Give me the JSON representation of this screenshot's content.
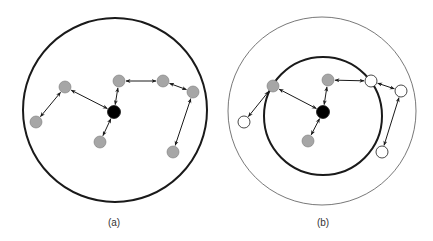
{
  "figure": {
    "panels": [
      {
        "id": "a",
        "caption": "(a)",
        "nodes": [
          {
            "id": "n1",
            "type": "gray"
          },
          {
            "id": "n2",
            "type": "gray"
          },
          {
            "id": "center",
            "type": "black"
          },
          {
            "id": "n3",
            "type": "gray"
          },
          {
            "id": "n4",
            "type": "gray"
          },
          {
            "id": "n5",
            "type": "gray"
          },
          {
            "id": "n6",
            "type": "gray"
          },
          {
            "id": "n7",
            "type": "gray"
          }
        ],
        "edges": [
          [
            "n2",
            "n1"
          ],
          [
            "n1",
            "center"
          ],
          [
            "center",
            "n3"
          ],
          [
            "center",
            "n4"
          ],
          [
            "n4",
            "n5"
          ],
          [
            "n5",
            "n6"
          ],
          [
            "n6",
            "n7"
          ]
        ]
      },
      {
        "id": "b",
        "caption": "(b)",
        "nodes": [
          {
            "id": "n1",
            "type": "gray"
          },
          {
            "id": "n2",
            "type": "white"
          },
          {
            "id": "center",
            "type": "black"
          },
          {
            "id": "n3",
            "type": "gray"
          },
          {
            "id": "n4",
            "type": "gray"
          },
          {
            "id": "n5",
            "type": "white"
          },
          {
            "id": "n6",
            "type": "white"
          },
          {
            "id": "n7",
            "type": "white"
          }
        ],
        "edges": [
          [
            "n2",
            "n1"
          ],
          [
            "n1",
            "center"
          ],
          [
            "center",
            "n3"
          ],
          [
            "center",
            "n4"
          ],
          [
            "n4",
            "n5"
          ],
          [
            "n5",
            "n6"
          ],
          [
            "n6",
            "n7"
          ]
        ]
      }
    ],
    "colors": {
      "gray_node": "#a6a6a6",
      "black_node": "#000000",
      "white_node": "#ffffff",
      "stroke": "#1a1a1a"
    }
  }
}
